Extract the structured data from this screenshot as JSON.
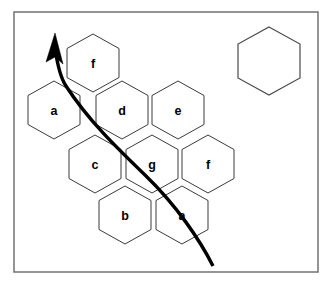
{
  "figure": {
    "background_color": "#ffffff",
    "frame": {
      "name": "figure-border",
      "x": 14,
      "y": 12,
      "width": 304,
      "height": 260,
      "stroke_color": "#7a7a7a"
    },
    "hex_geometry": {
      "orientation": "flat-top",
      "width": 52,
      "height": 58,
      "side_length": 29,
      "stroke_color": "#3a3a3a"
    },
    "cells": [
      {
        "id": "cell-f-top",
        "label": "f",
        "cx": 93,
        "cy": 63
      },
      {
        "id": "cell-a-left",
        "label": "a",
        "cx": 54,
        "cy": 110
      },
      {
        "id": "cell-d",
        "label": "d",
        "cx": 122,
        "cy": 110
      },
      {
        "id": "cell-e",
        "label": "e",
        "cx": 178,
        "cy": 110
      },
      {
        "id": "cell-c",
        "label": "c",
        "cx": 95,
        "cy": 164
      },
      {
        "id": "cell-g",
        "label": "g",
        "cx": 152,
        "cy": 164
      },
      {
        "id": "cell-f-right",
        "label": "f",
        "cx": 208,
        "cy": 164
      },
      {
        "id": "cell-b",
        "label": "b",
        "cx": 125,
        "cy": 215
      },
      {
        "id": "cell-a-bottom",
        "label": "a",
        "cx": 182,
        "cy": 215
      }
    ],
    "isolated_cell": {
      "id": "cell-isolated-legend",
      "label": "",
      "cx": 269,
      "cy": 61,
      "stroke_color": "#4a4a4a"
    },
    "path": {
      "name": "traversal-arrow",
      "stroke_color": "#000000",
      "stroke_width": 3.4,
      "direction": "bottom-right to top-left",
      "arrow_tip": {
        "x": 53,
        "y": 33
      },
      "start_point": {
        "x": 213,
        "y": 266
      },
      "curve_d": "M 213 266 C 200 240 176 205 146 176 C 116 147 88 120 66 86 C 60 77 57 62 55 48",
      "arrowhead_points": "55,33 63,64 55,57 46,62"
    }
  }
}
